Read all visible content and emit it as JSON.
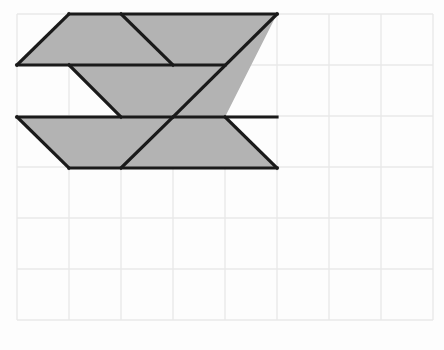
{
  "canvas": {
    "width": 444,
    "height": 350,
    "background": "#fdfdfd"
  },
  "grid": {
    "origin_x": 17,
    "origin_y": 14,
    "cell_width": 52,
    "cell_height": 51,
    "cols": 8,
    "rows": 6,
    "line_color": "#e8e8e8",
    "line_width": 1.4,
    "visible": true
  },
  "figure": {
    "fill_color": "#b3b3b3",
    "stroke_color": "#1a1a1a",
    "stroke_width": 3.2,
    "shapes": [
      {
        "name": "top-band",
        "type": "polygon",
        "points": "17,65 69,14 277,14 225,65",
        "filled": true
      },
      {
        "name": "top-right-wedge",
        "type": "polygon",
        "points": "225,65 277,14 277,14 225,65",
        "filled": true
      },
      {
        "name": "middle-band",
        "type": "polygon",
        "points": "69,65 225,65 277,14 225,117 121,117",
        "filled": true
      },
      {
        "name": "bottom-band",
        "type": "polygon",
        "points": "17,117 225,117 277,168 69,168",
        "filled": true
      },
      {
        "name": "bottom-right-notch",
        "type": "polygon",
        "points": "225,117 277,168 225,117 225,117",
        "filled": true
      }
    ],
    "interior_lines": [
      {
        "name": "line-top-left-diagonal",
        "x1": 17,
        "y1": 65,
        "x2": 69,
        "y2": 14
      },
      {
        "name": "line-top-edge",
        "x1": 69,
        "y1": 14,
        "x2": 277,
        "y2": 14
      },
      {
        "name": "line-upper-divider",
        "x1": 17,
        "y1": 65,
        "x2": 225,
        "y2": 65
      },
      {
        "name": "line-top-inner-diagonal",
        "x1": 121,
        "y1": 14,
        "x2": 173,
        "y2": 65
      },
      {
        "name": "line-long-diagonal",
        "x1": 277,
        "y1": 14,
        "x2": 173,
        "y2": 117
      },
      {
        "name": "line-middle-left-diagonal",
        "x1": 69,
        "y1": 65,
        "x2": 121,
        "y2": 117
      },
      {
        "name": "line-lower-divider",
        "x1": 17,
        "y1": 117,
        "x2": 277,
        "y2": 117
      },
      {
        "name": "line-bottom-left-diagonal",
        "x1": 17,
        "y1": 117,
        "x2": 69,
        "y2": 168
      },
      {
        "name": "line-bottom-edge",
        "x1": 69,
        "y1": 168,
        "x2": 277,
        "y2": 168
      },
      {
        "name": "line-bottom-inner-diagonal",
        "x1": 225,
        "y1": 117,
        "x2": 277,
        "y2": 168
      },
      {
        "name": "line-bottom-mid-diagonal",
        "x1": 121,
        "y1": 168,
        "x2": 173,
        "y2": 117
      }
    ]
  },
  "labels": {
    "none": ""
  }
}
